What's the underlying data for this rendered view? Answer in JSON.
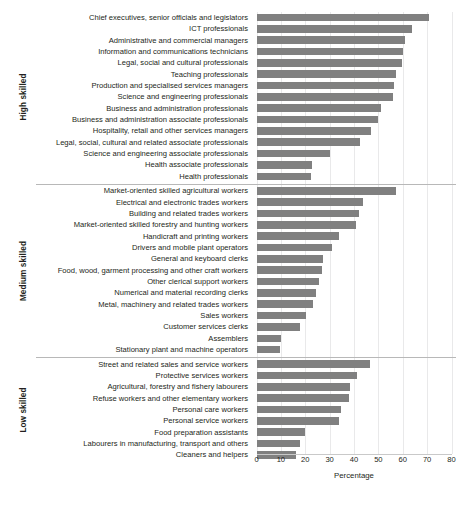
{
  "chart_data": {
    "type": "bar",
    "orientation": "horizontal",
    "title": "",
    "xlabel": "Percentage",
    "ylabel": "",
    "xlim": [
      0,
      80
    ],
    "xticks": [
      0,
      10,
      20,
      30,
      40,
      50,
      60,
      70,
      80
    ],
    "grid": true,
    "legend": null,
    "bar_color": "#808080",
    "groups": [
      {
        "name": "High skilled",
        "categories": [
          "Chief executives, senior officials and legislators",
          "ICT professionals",
          "Administrative and commercial managers",
          "Information and communications technicians",
          "Legal, social and cultural professionals",
          "Teaching professionals",
          "Production and specialised services managers",
          "Science and engineering professionals",
          "Business and administration professionals",
          "Business and administration associate professionals",
          "Hospitality, retail and other services managers",
          "Legal, social, cultural and related associate professionals",
          "Science and engineering associate professionals",
          "Health associate professionals",
          "Health professionals"
        ],
        "values": [
          70.8,
          63.6,
          61.1,
          60.0,
          59.7,
          57.2,
          56.6,
          55.8,
          51.0,
          50.0,
          46.9,
          42.3,
          30.2,
          22.6,
          22.3
        ]
      },
      {
        "name": "Medium skilled",
        "categories": [
          "Market-oriented skilled agricultural workers",
          "Electrical and electronic trades workers",
          "Building and related trades workers",
          "Market-oriented skilled forestry and hunting workers",
          "Handicraft and printing workers",
          "Drivers and mobile plant operators",
          "General and keyboard clerks",
          "Food, wood, garment processing and other craft workers",
          "Other clerical support workers",
          "Numerical and material recording clerks",
          "Metal, machinery and related trades workers",
          "Sales workers",
          "Customer services clerks",
          "Assemblers",
          "Stationary plant and machine operators"
        ],
        "values": [
          57.2,
          43.6,
          42.0,
          41.0,
          33.7,
          30.8,
          27.2,
          26.7,
          25.7,
          24.3,
          23.3,
          20.5,
          17.8,
          10.0,
          9.6
        ]
      },
      {
        "name": "Low skilled",
        "categories": [
          "Street and related sales and service workers",
          "Protective services workers",
          "Agricultural, forestry and fishery labourers",
          "Refuse workers and other elementary workers",
          "Personal care workers",
          "Personal service workers",
          "Food preparation assistants",
          "Labourers in manufacturing, transport and others",
          "Cleaners and helpers"
        ],
        "values": [
          46.6,
          41.2,
          38.4,
          37.8,
          34.7,
          34.0,
          20.0,
          18.0,
          16.0
        ]
      }
    ]
  }
}
